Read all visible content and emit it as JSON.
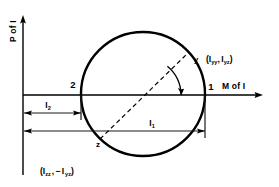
{
  "figure": {
    "background_color": "#ffffff",
    "line_color": "#000000"
  },
  "axes": {
    "vertical": {
      "label": "P of I",
      "name": "principal-of-inertia-axis",
      "orientation": "vertical",
      "arrow": "up"
    },
    "horizontal": {
      "label": "M of I",
      "name": "moment-of-inertia-axis",
      "orientation": "horizontal",
      "arrow": "right"
    }
  },
  "circle": {
    "center_x": 143,
    "center_y": 94,
    "radius": 62
  },
  "points": {
    "left_intersection": {
      "label": "2",
      "x": 81,
      "y": 95
    },
    "right_intersection": {
      "label": "1",
      "x": 205,
      "y": 95
    },
    "y_point": {
      "label": "y",
      "x": 190,
      "y": 59
    },
    "z_point": {
      "label": "z",
      "x": 100,
      "y": 133
    }
  },
  "annotations": {
    "y_coordinate": {
      "open": "(",
      "i1_symbol": "I",
      "i1_sub": "yy",
      "comma": ",",
      "i2_symbol": "I",
      "i2_sub": "yz",
      "close": ")",
      "full": "( I yy , I yz )"
    },
    "z_coordinate": {
      "open": "(",
      "i1_symbol": "I",
      "i1_sub": "zz",
      "comma": ",",
      "minus": "−",
      "i2_symbol": "I",
      "i2_sub": "yz",
      "close": ")",
      "full": "( I zz , − I yz )"
    }
  },
  "dimensions": {
    "i2": {
      "symbol": "I",
      "subscript": "2",
      "from_x": 23,
      "to_x": 81,
      "y": 113
    },
    "i1": {
      "symbol": "I",
      "subscript": "1",
      "from_x": 23,
      "to_x": 205,
      "y": 131
    }
  },
  "diameter": {
    "style": "dashed",
    "from": "z",
    "to": "y"
  },
  "angle_arc": {
    "name": "double-angle-arc",
    "has_arrowhead": true
  }
}
